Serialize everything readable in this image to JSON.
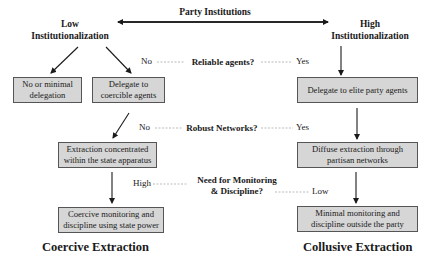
{
  "header": {
    "title": "Party Institutions",
    "left_pole": [
      "Low",
      "Institutionalization"
    ],
    "right_pole": [
      "High",
      "Institutionalization"
    ]
  },
  "questions": [
    {
      "label": "Reliable agents?",
      "left_answer": "No",
      "right_answer": "Yes"
    },
    {
      "label": "Robust Networks?",
      "left_answer": "No",
      "right_answer": "Yes"
    },
    {
      "label_lines": [
        "Need for Monitoring",
        "& Discipline?"
      ],
      "left_answer": "High",
      "right_answer": "Low"
    }
  ],
  "boxes": {
    "no_delegation": [
      "No or minimal",
      "delegation"
    ],
    "coercible_agents": [
      "Delegate to",
      "coercible agents"
    ],
    "elite_agents": [
      "Delegate to elite party agents"
    ],
    "state_extraction": [
      "Extraction concentrated",
      "within the state apparatus"
    ],
    "diffuse_extraction": [
      "Diffuse extraction through",
      "partisan networks"
    ],
    "coercive_monitoring": [
      "Coercive monitoring and",
      "discipline using state power"
    ],
    "minimal_monitoring": [
      "Minimal monitoring and",
      "discipline outside the party"
    ]
  },
  "outcomes": {
    "left": "Coercive Extraction",
    "right": "Collusive Extraction"
  },
  "colors": {
    "box_fill": "#d6d6d6",
    "box_border": "#555555",
    "arrow": "#1a1a1a",
    "dashed": "#aaaaaa"
  }
}
